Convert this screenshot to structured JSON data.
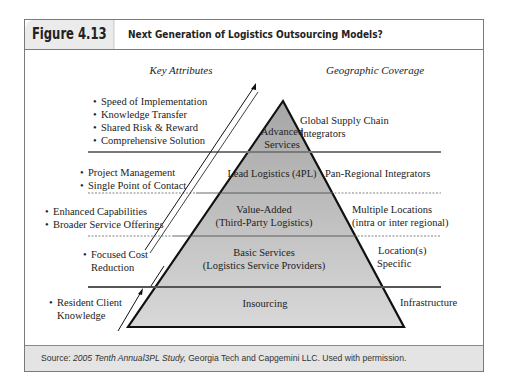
{
  "figure": {
    "label": "Figure 4.13",
    "title": "Next Generation of Logistics Outsourcing Models?"
  },
  "columns": {
    "left_heading": "Key Attributes",
    "right_heading": "Geographic Coverage"
  },
  "tiers": [
    {
      "name_lines": [
        "Advanced",
        "Services"
      ],
      "attributes": [
        "Speed of Implementation",
        "Knowledge Transfer",
        "Shared Risk & Reward",
        "Comprehensive Solution"
      ],
      "coverage_lines": [
        "Global Supply Chain",
        "Integrators"
      ]
    },
    {
      "name_lines": [
        "Lead Logistics (4PL)"
      ],
      "attributes": [
        "Project Management",
        "Single Point of Contact"
      ],
      "coverage_lines": [
        "Pan-Regional Integrators"
      ]
    },
    {
      "name_lines": [
        "Value-Added",
        "(Third-Party Logistics)"
      ],
      "attributes": [
        "Enhanced Capabilities",
        "Broader Service Offerings"
      ],
      "coverage_lines": [
        "Multiple Locations",
        "(intra or inter regional)"
      ]
    },
    {
      "name_lines": [
        "Basic Services",
        "(Logistics Service Providers)"
      ],
      "attributes_lines": [
        "Focused Cost",
        "Reduction"
      ],
      "coverage_lines": [
        "Location(s)",
        "Specific"
      ]
    },
    {
      "name_lines": [
        "Insourcing"
      ],
      "attributes_lines": [
        "Resident Client",
        "Knowledge"
      ],
      "coverage_lines": [
        "Infrastructure"
      ]
    }
  ],
  "footer": {
    "prefix": "Source: ",
    "italic": "2005 Tenth Annual3PL Study,",
    "rest": " Georgia Tech and Capgemini LLC. Used with permission."
  },
  "colors": {
    "pyramid_fill_top": "#a9a9a9",
    "pyramid_fill_bottom": "#d6d6d6",
    "outline": "#111111",
    "separator": "#777777",
    "footer_bg": "#e4e4e4"
  }
}
